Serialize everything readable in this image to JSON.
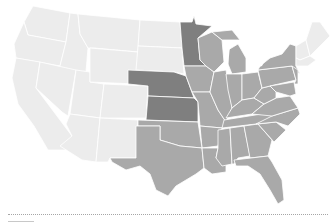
{
  "map": {
    "type": "choropleth",
    "region": "United States (contiguous)",
    "legend_visible": false,
    "colors": {
      "light": "#ececec",
      "medium": "#a9a9a9",
      "dark": "#7f7f7f",
      "border": "#ffffff",
      "background": "#ffffff"
    },
    "categories": {
      "dark": [
        "Minnesota",
        "Nebraska",
        "Kansas"
      ],
      "medium": [
        "North Dakota?",
        "Iowa",
        "Missouri",
        "Wisconsin",
        "Illinois",
        "Michigan",
        "Indiana",
        "Ohio",
        "Kentucky",
        "Tennessee",
        "Arkansas",
        "Oklahoma",
        "Texas",
        "Louisiana",
        "Mississippi",
        "Alabama",
        "Georgia",
        "Florida",
        "South Carolina",
        "North Carolina",
        "Virginia",
        "West Virginia",
        "Pennsylvania",
        "New York",
        "New Jersey",
        "Maryland",
        "Delaware"
      ],
      "light": [
        "Washington",
        "Oregon",
        "California",
        "Idaho",
        "Nevada",
        "Utah",
        "Arizona",
        "Montana",
        "Wyoming",
        "Colorado",
        "New Mexico",
        "North Dakota",
        "South Dakota",
        "Maine",
        "New Hampshire",
        "Vermont",
        "Massachusetts",
        "Connecticut",
        "Rhode Island"
      ]
    }
  },
  "footer": {
    "divider_style": "dotted"
  }
}
